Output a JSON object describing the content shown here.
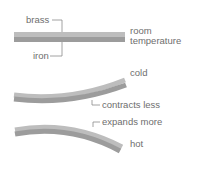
{
  "diagram": {
    "labels": {
      "brass": "brass",
      "iron": "iron",
      "room_line1": "room",
      "room_line2": "temperature",
      "cold": "cold",
      "contracts_less": "contracts less",
      "expands_more": "expands more",
      "hot": "hot"
    },
    "colors": {
      "brass": "#bdbdbd",
      "iron": "#9c9c9c",
      "leader": "#8a8a8a",
      "text": "#6e6e6e"
    },
    "states": [
      {
        "name": "room temperature",
        "shape": "straight"
      },
      {
        "name": "cold",
        "shape": "curved up (brass contracts less)"
      },
      {
        "name": "hot",
        "shape": "curved down (brass expands more)"
      }
    ]
  }
}
